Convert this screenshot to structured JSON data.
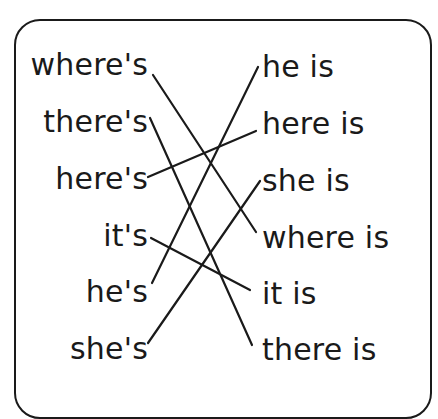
{
  "exercise": {
    "left_column": [
      "where's",
      "there's",
      "here's",
      "it's",
      "he's",
      "she's"
    ],
    "right_column": [
      "he is",
      "here is",
      "she is",
      "where is",
      "it is",
      "there is"
    ],
    "matches": [
      {
        "from": "where's",
        "to": "where is"
      },
      {
        "from": "there's",
        "to": "there is"
      },
      {
        "from": "here's",
        "to": "here is"
      },
      {
        "from": "it's",
        "to": "it is"
      },
      {
        "from": "he's",
        "to": "he is"
      },
      {
        "from": "she's",
        "to": "she is"
      }
    ],
    "line_color": "#1a1a1a"
  }
}
